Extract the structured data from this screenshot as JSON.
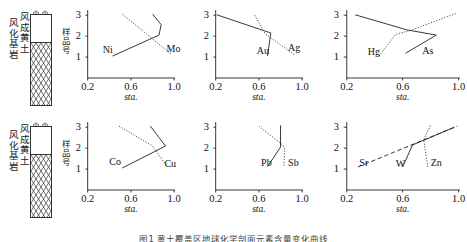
{
  "figure": {
    "caption": "图1  黄土覆盖区地球化学剖面元素含量变化曲线",
    "axis": {
      "ylabel": "样品号",
      "xlabel": "sta.",
      "yticks": [
        "1",
        "2",
        "3"
      ],
      "xticks": [
        "0.2",
        "0.6",
        "1.0"
      ],
      "xlim": [
        0.2,
        1.0
      ],
      "ylim": [
        0,
        3.2
      ]
    },
    "lithology": {
      "label_upper": "风成黄土",
      "label_lower": "风化基岩",
      "upper_name": "aeolian-loess",
      "lower_name": "weathered-bedrock"
    }
  },
  "chart_data": [
    {
      "id": "panel-ni-mo",
      "type": "line",
      "title": "",
      "xlabel": "sta.",
      "ylabel": "样品号",
      "xlim": [
        0.2,
        1.0
      ],
      "ylim": [
        0,
        3.2
      ],
      "xticks": [
        0.2,
        0.6,
        1.0
      ],
      "yticks": [
        1,
        2,
        3
      ],
      "grid": false,
      "legend_position": "inline-annotation",
      "series": [
        {
          "name": "Ni",
          "style": "solid",
          "label_x": 0.34,
          "label_y": 1.35,
          "x": [
            0.43,
            0.86,
            0.88,
            0.8
          ],
          "y": [
            1.05,
            2.05,
            2.55,
            3.05
          ]
        },
        {
          "name": "Mo",
          "style": "dotted",
          "label_x": 0.93,
          "label_y": 1.4,
          "x": [
            0.52,
            0.97
          ],
          "y": [
            3.05,
            1.15
          ]
        }
      ]
    },
    {
      "id": "panel-au-ag",
      "type": "line",
      "title": "",
      "xlabel": "sta.",
      "ylabel": "样品号",
      "xlim": [
        0.2,
        1.0
      ],
      "ylim": [
        0,
        3.2
      ],
      "xticks": [
        0.2,
        0.6,
        1.0
      ],
      "yticks": [
        1,
        2,
        3
      ],
      "grid": false,
      "legend_position": "inline-annotation",
      "series": [
        {
          "name": "Au",
          "style": "solid",
          "label_x": 0.58,
          "label_y": 1.3,
          "x": [
            0.68,
            0.71,
            0.21
          ],
          "y": [
            1.05,
            2.15,
            3.02
          ]
        },
        {
          "name": "Ag",
          "style": "dotted",
          "label_x": 0.87,
          "label_y": 1.45,
          "x": [
            0.56,
            0.66,
            0.93
          ],
          "y": [
            3.0,
            2.1,
            1.1
          ]
        }
      ]
    },
    {
      "id": "panel-hg-as",
      "type": "line",
      "title": "",
      "xlabel": "sta.",
      "ylabel": "样品号",
      "xlim": [
        0.2,
        1.0
      ],
      "ylim": [
        0,
        3.2
      ],
      "xticks": [
        0.2,
        0.6,
        1.0
      ],
      "yticks": [
        1,
        2,
        3
      ],
      "grid": false,
      "legend_position": "inline-annotation",
      "series": [
        {
          "name": "Hg",
          "style": "solid",
          "label_x": 0.35,
          "label_y": 1.25,
          "x": [
            0.26,
            0.63,
            0.84
          ],
          "y": [
            3.02,
            2.3,
            2.05
          ]
        },
        {
          "name": "As",
          "style": "dotted",
          "label_x": 0.74,
          "label_y": 1.3,
          "x": [
            0.43,
            0.55,
            0.66,
            0.98
          ],
          "y": [
            1.05,
            2.08,
            2.28,
            3.08
          ]
        },
        {
          "name": "As-solid-tail",
          "style": "solid",
          "label_x": null,
          "label_y": null,
          "x": [
            0.62,
            0.84
          ],
          "y": [
            1.18,
            2.05
          ]
        }
      ]
    },
    {
      "id": "panel-co-cu",
      "type": "line",
      "title": "",
      "xlabel": "sta.",
      "ylabel": "样品号",
      "xlim": [
        0.2,
        1.0
      ],
      "ylim": [
        0,
        3.2
      ],
      "xticks": [
        0.2,
        0.6,
        1.0
      ],
      "yticks": [
        1,
        2,
        3
      ],
      "grid": false,
      "legend_position": "inline-annotation",
      "series": [
        {
          "name": "Co",
          "style": "solid",
          "label_x": 0.4,
          "label_y": 1.33,
          "x": [
            0.52,
            0.92,
            0.78
          ],
          "y": [
            1.05,
            2.1,
            3.05
          ]
        },
        {
          "name": "Cu",
          "style": "dotted",
          "label_x": 0.91,
          "label_y": 1.25,
          "x": [
            0.49,
            0.8,
            0.93
          ],
          "y": [
            3.05,
            2.1,
            1.15
          ]
        }
      ]
    },
    {
      "id": "panel-pb-sb",
      "type": "line",
      "title": "",
      "xlabel": "sta.",
      "ylabel": "样品号",
      "xlim": [
        0.2,
        1.0
      ],
      "ylim": [
        0,
        3.2
      ],
      "xticks": [
        0.2,
        0.6,
        1.0
      ],
      "yticks": [
        1,
        2,
        3
      ],
      "grid": false,
      "legend_position": "inline-annotation",
      "series": [
        {
          "name": "Pb",
          "style": "solid",
          "label_x": 0.62,
          "label_y": 1.3,
          "x": [
            0.68,
            0.8,
            0.8
          ],
          "y": [
            1.12,
            2.05,
            3.08
          ]
        },
        {
          "name": "Sb",
          "style": "dotted",
          "label_x": 0.87,
          "label_y": 1.3,
          "x": [
            0.6,
            0.82,
            0.84,
            0.83
          ],
          "y": [
            3.05,
            2.15,
            1.95,
            1.1
          ]
        }
      ]
    },
    {
      "id": "panel-sr-w-zn",
      "type": "line",
      "title": "",
      "xlabel": "sta.",
      "ylabel": "样品号",
      "xlim": [
        0.2,
        1.0
      ],
      "ylim": [
        0,
        3.2
      ],
      "xticks": [
        0.2,
        0.6,
        1.0
      ],
      "yticks": [
        1,
        2,
        3
      ],
      "grid": false,
      "legend_position": "inline-annotation",
      "series": [
        {
          "name": "Sr",
          "style": "dashed",
          "label_x": 0.29,
          "label_y": 1.3,
          "x": [
            0.28,
            0.99
          ],
          "y": [
            1.1,
            3.05
          ]
        },
        {
          "name": "W",
          "style": "solid",
          "label_x": 0.55,
          "label_y": 1.25,
          "x": [
            0.6,
            0.67,
            0.97
          ],
          "y": [
            1.1,
            2.15,
            3.0
          ]
        },
        {
          "name": "Zn",
          "style": "dotted",
          "label_x": 0.8,
          "label_y": 1.3,
          "x": [
            0.78,
            0.75,
            0.8
          ],
          "y": [
            1.1,
            2.4,
            3.1
          ]
        }
      ]
    }
  ]
}
